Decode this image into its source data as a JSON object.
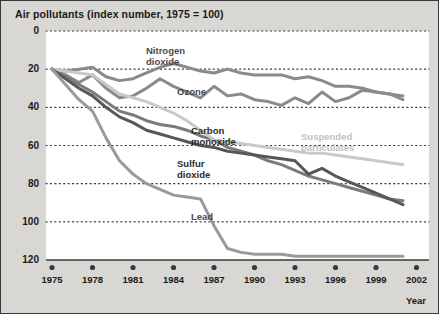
{
  "chart_data": {
    "type": "line",
    "title": "Air pollutants (index number, 1975 = 100)",
    "xlabel": "Year",
    "ylabel": "",
    "xlim": [
      1975,
      2002
    ],
    "ylim": [
      0,
      120
    ],
    "yticks": [
      0,
      20,
      40,
      60,
      80,
      100,
      120
    ],
    "xticks": [
      1975,
      1978,
      1981,
      1984,
      1987,
      1990,
      1993,
      1996,
      1999,
      2002
    ],
    "grid": "horizontal-dotted",
    "legend": "inline-annotations",
    "x": [
      1975,
      1976,
      1977,
      1978,
      1979,
      1980,
      1981,
      1982,
      1983,
      1984,
      1985,
      1986,
      1987,
      1988,
      1989,
      1990,
      1991,
      1992,
      1993,
      1994,
      1995,
      1996,
      1997,
      1998,
      1999,
      2000,
      2001
    ],
    "series": [
      {
        "name": "Nitrogen dioxide",
        "color": "#8a8a8a",
        "values": [
          100,
          99,
          100,
          101,
          96,
          94,
          95,
          98,
          101,
          103,
          101,
          99,
          98,
          100,
          98,
          97,
          97,
          97,
          95,
          96,
          94,
          91,
          91,
          90,
          88,
          87,
          84
        ]
      },
      {
        "name": "Ozone",
        "color": "#8a8a8a",
        "values": [
          100,
          97,
          93,
          97,
          90,
          85,
          86,
          90,
          95,
          91,
          88,
          85,
          91,
          86,
          87,
          84,
          83,
          81,
          85,
          82,
          88,
          83,
          85,
          89,
          88,
          87,
          86
        ]
      },
      {
        "name": "Carbon monoxide",
        "color": "#7b7b7b",
        "values": [
          100,
          96,
          92,
          88,
          83,
          78,
          76,
          73,
          71,
          70,
          68,
          65,
          63,
          59,
          57,
          55,
          52,
          50,
          47,
          44,
          42,
          40,
          38,
          36,
          34,
          32,
          31
        ]
      },
      {
        "name": "Suspended particulates",
        "color": "#c9c9c9",
        "values": [
          100,
          99,
          98,
          97,
          92,
          87,
          85,
          83,
          80,
          77,
          73,
          68,
          63,
          62,
          61,
          60,
          59,
          58,
          57,
          56,
          56,
          55,
          54,
          53,
          52,
          51,
          50
        ]
      },
      {
        "name": "Sulfur dioxide",
        "color": "#575757",
        "values": [
          100,
          95,
          90,
          86,
          80,
          75,
          72,
          68,
          66,
          64,
          62,
          60,
          59,
          57,
          56,
          55,
          54,
          53,
          52,
          45,
          48,
          44,
          41,
          38,
          35,
          32,
          29
        ]
      },
      {
        "name": "Lead",
        "color": "#9a9a9a",
        "values": [
          100,
          92,
          84,
          78,
          64,
          52,
          45,
          40,
          37,
          34,
          33,
          32,
          18,
          6,
          4,
          3,
          3,
          3,
          2,
          2,
          2,
          2,
          2,
          2,
          2,
          2,
          2
        ]
      }
    ],
    "annotations": [
      {
        "text": "Nitrogen",
        "series": "Nitrogen dioxide"
      },
      {
        "text": "dioxide",
        "series": "Nitrogen dioxide"
      },
      {
        "text": "Ozone",
        "series": "Ozone"
      },
      {
        "text": "Carbon",
        "series": "Carbon monoxide"
      },
      {
        "text": "monoxide",
        "series": "Carbon monoxide"
      },
      {
        "text": "Suspended",
        "series": "Suspended particulates"
      },
      {
        "text": "particulates",
        "series": "Suspended particulates"
      },
      {
        "text": "Sulfur",
        "series": "Sulfur dioxide"
      },
      {
        "text": "dioxide",
        "series": "Sulfur dioxide"
      },
      {
        "text": "Lead",
        "series": "Lead"
      }
    ]
  },
  "labels": {
    "y": [
      "120",
      "100",
      "80",
      "60",
      "40",
      "20",
      "0"
    ],
    "x": [
      "1975",
      "1978",
      "1981",
      "1984",
      "1987",
      "1990",
      "1993",
      "1996",
      "1999",
      "2002"
    ],
    "year_axis": "Year",
    "nitrogen_1": "Nitrogen",
    "nitrogen_2": "dioxide",
    "ozone": "Ozone",
    "carbon_1": "Carbon",
    "carbon_2": "monoxide",
    "suspended_1": "Suspended",
    "suspended_2": "particulates",
    "sulfur_1": "Sulfur",
    "sulfur_2": "dioxide",
    "lead": "Lead"
  },
  "colors": {
    "panel_bg": "#d9d7d3",
    "plot_bg": "#ffffff",
    "grid": "#3a3a3a",
    "text": "#1a1a1a",
    "nitrogen_dioxide": "#8a8a8a",
    "ozone": "#8a8a8a",
    "carbon_monoxide": "#7b7b7b",
    "suspended_particulates": "#c9c9c9",
    "sulfur_dioxide": "#575757",
    "lead": "#9a9a9a"
  }
}
